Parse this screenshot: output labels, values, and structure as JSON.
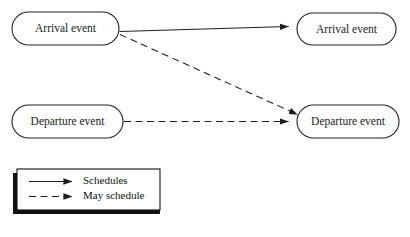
{
  "diagram": {
    "type": "event-scheduling-graph",
    "colors": {
      "stroke": "#222222",
      "node_fill": "#ffffff",
      "shadow": "#111111",
      "legend_fill": "#ffffff",
      "text": "#1a1a1a"
    },
    "nodes": [
      {
        "id": "arrival-source",
        "label": "Arrival event",
        "x": 12,
        "y": 12,
        "w": 107,
        "h": 33
      },
      {
        "id": "arrival-target",
        "label": "Arrival event",
        "x": 297,
        "y": 13,
        "w": 99,
        "h": 32
      },
      {
        "id": "departure-source",
        "label": "Departure event",
        "x": 12,
        "y": 105,
        "w": 111,
        "h": 33
      },
      {
        "id": "departure-target",
        "label": "Departure event",
        "x": 297,
        "y": 105,
        "w": 102,
        "h": 33
      }
    ],
    "edges": [
      {
        "id": "arrival-schedules-arrival",
        "style": "solid",
        "from": "arrival-source",
        "to": "arrival-target",
        "relation": "Schedules"
      },
      {
        "id": "arrival-may-schedule-departure",
        "style": "dashed",
        "from": "arrival-source",
        "to": "departure-target",
        "relation": "May schedule"
      },
      {
        "id": "departure-may-schedule-departure",
        "style": "dashed",
        "from": "departure-source",
        "to": "departure-target",
        "relation": "May schedule"
      }
    ]
  },
  "legend": {
    "title": "",
    "items": [
      {
        "id": "legend-solid",
        "style": "solid",
        "label": "Schedules"
      },
      {
        "id": "legend-dashed",
        "style": "dashed",
        "label": "May schedule"
      }
    ]
  }
}
